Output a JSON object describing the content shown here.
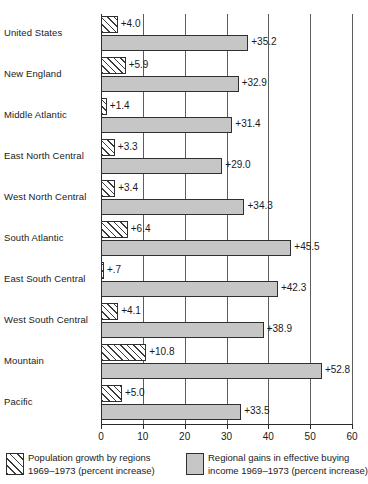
{
  "chart_data": {
    "type": "bar",
    "orientation": "horizontal",
    "title": "",
    "xlabel": "",
    "ylabel": "",
    "xlim": [
      0,
      60
    ],
    "grid": true,
    "grid_axis": "x",
    "tick_labels": [
      "0",
      "10",
      "20",
      "30",
      "40",
      "50",
      "60"
    ],
    "ticks": [
      0,
      10,
      20,
      30,
      40,
      50,
      60
    ],
    "legend_position": "bottom",
    "categories": [
      "United States",
      "New England",
      "Middle Atlantic",
      "East North Central",
      "West North Central",
      "South Atlantic",
      "East South Central",
      "West South Central",
      "Mountain",
      "Pacific"
    ],
    "series": [
      {
        "name": "Population growth by regions 1969-1973 (percent increase)",
        "short_name": "population-growth",
        "style": "hatched",
        "values": [
          4.0,
          5.9,
          1.4,
          3.3,
          3.4,
          6.4,
          0.7,
          4.1,
          10.8,
          5.0
        ],
        "labels": [
          "+4.0",
          "+5.9",
          "+1.4",
          "+3.3",
          "+3.4",
          "+6.4",
          "+.7",
          "+4.1",
          "+10.8",
          "+5.0"
        ]
      },
      {
        "name": "Regional gains in effective buying income 1969-1973 (percent increase)",
        "short_name": "buying-income-gains",
        "style": "solid-gray",
        "values": [
          35.2,
          32.9,
          31.4,
          29.0,
          34.3,
          45.5,
          42.3,
          38.9,
          52.8,
          33.5
        ],
        "labels": [
          "+35.2",
          "+32.9",
          "+31.4",
          "+29.0",
          "+34.3",
          "+45.5",
          "+42.3",
          "+38.9",
          "+52.8",
          "+33.5"
        ]
      }
    ]
  },
  "legend": {
    "items": [
      {
        "swatch": "hatched",
        "line1": "Population growth by regions",
        "line2": "1969–1973 (percent increase)"
      },
      {
        "swatch": "solid-gray",
        "line1": "Regional gains in effective buying",
        "line2": "income  1969–1973 (percent increase)"
      }
    ]
  },
  "colors": {
    "hatch_fill": "#ededed",
    "hatch_line": "#3a3a3a",
    "solid_bar": "#c6c6c6",
    "bar_border": "#2f2f2f",
    "gridline": "#5d5d5d",
    "axis": "#2b2b2b",
    "text": "#1a1a1a",
    "background": "#ffffff"
  }
}
